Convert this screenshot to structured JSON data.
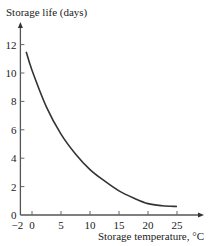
{
  "chart_data": {
    "type": "line",
    "title": "",
    "xlabel": "Storage temperature, °C",
    "ylabel": "Storage life (days)",
    "xlim": [
      -2,
      29
    ],
    "ylim": [
      0,
      14
    ],
    "xticks": [
      -2,
      0,
      5,
      10,
      15,
      20,
      25
    ],
    "xtick_labels": [
      "−2",
      "0",
      "5",
      "10",
      "15",
      "20",
      "25"
    ],
    "yticks": [
      0,
      2,
      4,
      6,
      8,
      10,
      12
    ],
    "ytick_labels": [
      "0",
      "2",
      "4",
      "6",
      "8",
      "10",
      "12"
    ],
    "grid": false,
    "legend": null,
    "series": [
      {
        "name": "Storage life",
        "x": [
          -1,
          0,
          2.5,
          5,
          7.5,
          10,
          12.5,
          15,
          17.5,
          20,
          22.5,
          25
        ],
        "y": [
          11.5,
          10.2,
          7.6,
          5.7,
          4.3,
          3.2,
          2.4,
          1.7,
          1.2,
          0.8,
          0.65,
          0.6
        ]
      }
    ]
  }
}
